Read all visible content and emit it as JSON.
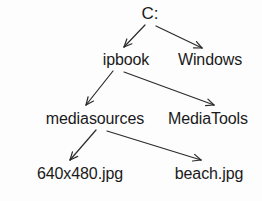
{
  "diagram": {
    "kind": "directory-tree",
    "background_color": "#fdfdfd",
    "text_color": "#1a1a1a",
    "edge_color": "#2b2b2b",
    "nodes": [
      {
        "id": "drive-c",
        "label": "C:",
        "x": 150,
        "y": 14,
        "level": 0
      },
      {
        "id": "ipbook",
        "label": "ipbook",
        "x": 126,
        "y": 60,
        "level": 1
      },
      {
        "id": "windows",
        "label": "Windows",
        "x": 210,
        "y": 60,
        "level": 1
      },
      {
        "id": "mediasources",
        "label": "mediasources",
        "x": 95,
        "y": 119,
        "level": 2
      },
      {
        "id": "mediatools",
        "label": "MediaTools",
        "x": 208,
        "y": 119,
        "level": 2
      },
      {
        "id": "image-640",
        "label": "640x480.jpg",
        "x": 80,
        "y": 174,
        "level": 3
      },
      {
        "id": "image-beach",
        "label": "beach.jpg",
        "x": 209,
        "y": 174,
        "level": 3
      }
    ],
    "edges": [
      {
        "id": "edge-c-ipbook",
        "from": "drive-c",
        "to": "ipbook",
        "x1": 145,
        "y1": 25,
        "x2": 124,
        "y2": 47
      },
      {
        "id": "edge-c-windows",
        "from": "drive-c",
        "to": "windows",
        "x1": 156,
        "y1": 26,
        "x2": 202,
        "y2": 48
      },
      {
        "id": "edge-ipbook-mediasources",
        "from": "ipbook",
        "to": "mediasources",
        "x1": 113,
        "y1": 71,
        "x2": 86,
        "y2": 105
      },
      {
        "id": "edge-ipbook-mediatools",
        "from": "ipbook",
        "to": "mediatools",
        "x1": 124,
        "y1": 72,
        "x2": 214,
        "y2": 105
      },
      {
        "id": "edge-mediasources-640",
        "from": "mediasources",
        "to": "image-640",
        "x1": 96,
        "y1": 130,
        "x2": 70,
        "y2": 160
      },
      {
        "id": "edge-mediasources-beach",
        "from": "mediasources",
        "to": "image-beach",
        "x1": 107,
        "y1": 131,
        "x2": 201,
        "y2": 160
      }
    ]
  }
}
